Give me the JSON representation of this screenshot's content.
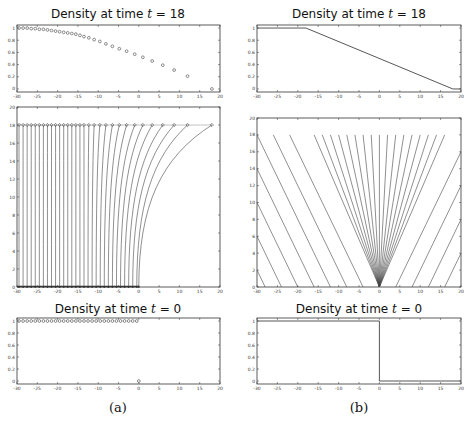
{
  "figure": {
    "captions": [
      "(a)",
      "(b)"
    ]
  },
  "chart_data": [
    {
      "id": "a-top",
      "type": "scatter",
      "title": "Density at time t = 18",
      "title_prefix": "Density at time ",
      "title_var": "t",
      "title_suffix": " = 18",
      "xlim": [
        -30,
        20
      ],
      "ylim": [
        -0.05,
        1.05
      ],
      "xticks": [
        -30,
        -25,
        -20,
        -15,
        -10,
        -5,
        0,
        5,
        10,
        15,
        20
      ],
      "yticks": [
        0,
        0.2,
        0.4,
        0.6,
        0.8,
        1
      ],
      "ytick_labels": [
        "0",
        "0.2",
        "0.4",
        "0.6",
        "0.8",
        "1"
      ],
      "marker": "circle",
      "x": [
        -29.5,
        -28.5,
        -27.5,
        -26.5,
        -25.5,
        -24.5,
        -23.5,
        -22.5,
        -21.5,
        -20.5,
        -19.5,
        -18.5,
        -17.5,
        -16.5,
        -15.5,
        -14.5,
        -13.5,
        -12.3,
        -11,
        -9.6,
        -8.1,
        -6.5,
        -4.8,
        -3,
        -1,
        1,
        3.3,
        5.9,
        8.7,
        12,
        18
      ],
      "y": [
        1,
        1,
        1,
        0.99,
        0.99,
        0.98,
        0.98,
        0.97,
        0.96,
        0.95,
        0.94,
        0.93,
        0.92,
        0.91,
        0.9,
        0.88,
        0.86,
        0.84,
        0.81,
        0.78,
        0.74,
        0.7,
        0.66,
        0.62,
        0.57,
        0.52,
        0.46,
        0.39,
        0.31,
        0.21,
        0
      ]
    },
    {
      "id": "a-mid",
      "type": "line",
      "title": "",
      "description": "Particle trajectories in x-t plane",
      "xlim": [
        -30,
        20
      ],
      "ylim": [
        0,
        20
      ],
      "xticks": [
        -30,
        -25,
        -20,
        -15,
        -10,
        -5,
        0,
        5,
        10,
        15,
        20
      ],
      "yticks": [
        0,
        2,
        4,
        6,
        8,
        10,
        12,
        14,
        16,
        18,
        20
      ],
      "start_x": [
        -29.5,
        -28.5,
        -27.5,
        -26.5,
        -25.5,
        -24.5,
        -23.5,
        -22.5,
        -21.5,
        -20.5,
        -19.5,
        -18.5,
        -17.5,
        -16.5,
        -15.5,
        -14.5,
        -13.5,
        -12.5,
        -11.5,
        -10.5,
        -9.5,
        -8.5,
        -7.5,
        -6.5,
        -5.5,
        -4.5,
        -3.5,
        -2.5,
        -1.5,
        -0.5,
        0
      ],
      "end_x": [
        -29.5,
        -28.5,
        -27.5,
        -26.5,
        -25.5,
        -24.5,
        -23.5,
        -22.5,
        -21.5,
        -20.5,
        -19.5,
        -18.5,
        -17.5,
        -16.5,
        -15.5,
        -14.5,
        -13.5,
        -12.3,
        -11,
        -9.6,
        -8.1,
        -6.5,
        -4.8,
        -3,
        -1,
        1,
        3.3,
        5.9,
        8.7,
        12,
        18
      ],
      "t_end": 18
    },
    {
      "id": "a-bot",
      "type": "scatter",
      "title": "Density at time t = 0",
      "title_prefix": "Density at time ",
      "title_var": "t",
      "title_suffix": " = 0",
      "xlim": [
        -30,
        20
      ],
      "ylim": [
        -0.05,
        1.05
      ],
      "xticks": [
        -30,
        -25,
        -20,
        -15,
        -10,
        -5,
        0,
        5,
        10,
        15,
        20
      ],
      "yticks": [
        0,
        0.2,
        0.4,
        0.6,
        0.8,
        1
      ],
      "ytick_labels": [
        "0",
        "0.2",
        "0.4",
        "0.6",
        "0.8",
        "1"
      ],
      "marker": "circle",
      "x": [
        -29.5,
        -28.5,
        -27.5,
        -26.5,
        -25.5,
        -24.5,
        -23.5,
        -22.5,
        -21.5,
        -20.5,
        -19.5,
        -18.5,
        -17.5,
        -16.5,
        -15.5,
        -14.5,
        -13.5,
        -12.5,
        -11.5,
        -10.5,
        -9.5,
        -8.5,
        -7.5,
        -6.5,
        -5.5,
        -4.5,
        -3.5,
        -2.5,
        -1.5,
        -0.5,
        0
      ],
      "y": [
        1,
        1,
        1,
        1,
        1,
        1,
        1,
        1,
        1,
        1,
        1,
        1,
        1,
        1,
        1,
        1,
        1,
        1,
        1,
        1,
        1,
        1,
        1,
        1,
        1,
        1,
        1,
        1,
        1,
        1,
        0
      ]
    },
    {
      "id": "b-top",
      "type": "line",
      "title": "Density at time t = 18",
      "title_prefix": "Density at time ",
      "title_var": "t",
      "title_suffix": " = 18",
      "xlim": [
        -30,
        20
      ],
      "ylim": [
        -0.05,
        1.05
      ],
      "xticks": [
        -30,
        -25,
        -20,
        -15,
        -10,
        -5,
        0,
        5,
        10,
        15,
        20
      ],
      "yticks": [
        0,
        0.2,
        0.4,
        0.6,
        0.8,
        1
      ],
      "ytick_labels": [
        "0",
        "0.2",
        "0.4",
        "0.6",
        "0.8",
        "1"
      ],
      "x": [
        -30,
        -18,
        18,
        20
      ],
      "y": [
        1,
        1,
        0,
        0
      ]
    },
    {
      "id": "b-mid",
      "type": "line",
      "title": "",
      "description": "Characteristics in x-t plane with rarefaction fan from origin",
      "xlim": [
        -30,
        20
      ],
      "ylim": [
        0,
        20
      ],
      "xticks": [
        -30,
        -25,
        -20,
        -15,
        -10,
        -5,
        0,
        5,
        10,
        15,
        20
      ],
      "yticks": [
        0,
        2,
        4,
        6,
        8,
        10,
        12,
        14,
        16,
        18,
        20
      ],
      "left_starts": [
        -28,
        -24,
        -20,
        -16,
        -12,
        -8,
        -4
      ],
      "right_starts": [
        4,
        8,
        12,
        16
      ],
      "fan_end_x": [
        -16,
        -14,
        -12,
        -10,
        -8,
        -6,
        -4,
        -2,
        0,
        2,
        4,
        6,
        8,
        10,
        12,
        14,
        16
      ],
      "t_end": 18
    },
    {
      "id": "b-bot",
      "type": "line",
      "title": "Density at time t = 0",
      "title_prefix": "Density at time ",
      "title_var": "t",
      "title_suffix": " = 0",
      "xlim": [
        -30,
        20
      ],
      "ylim": [
        -0.05,
        1.05
      ],
      "xticks": [
        -30,
        -25,
        -20,
        -15,
        -10,
        -5,
        0,
        5,
        10,
        15,
        20
      ],
      "yticks": [
        0,
        0.2,
        0.4,
        0.6,
        0.8,
        1
      ],
      "ytick_labels": [
        "0",
        "0.2",
        "0.4",
        "0.6",
        "0.8",
        "1"
      ],
      "x": [
        -30,
        0,
        0,
        20
      ],
      "y": [
        1,
        1,
        0,
        0
      ]
    }
  ]
}
